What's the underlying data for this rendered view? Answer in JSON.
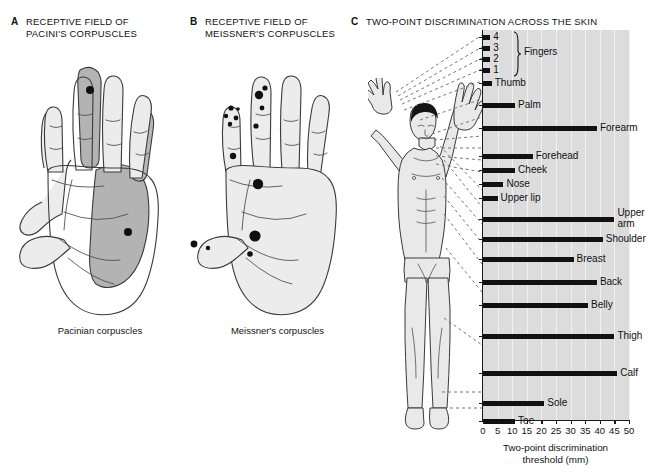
{
  "panels": {
    "a": {
      "letter": "A",
      "title": "RECEPTIVE FIELD OF PACINI'S CORPUSCLES",
      "caption": "Pacinian corpuscles"
    },
    "b": {
      "letter": "B",
      "title": "RECEPTIVE FIELD OF MEISSNER'S CORPUSCLES",
      "caption": "Meissner's corpuscles"
    },
    "c": {
      "letter": "C",
      "title": "TWO-POINT DISCRIMINATION ACROSS THE SKIN"
    }
  },
  "chart_data": {
    "type": "bar",
    "orientation": "horizontal",
    "title": "TWO-POINT DISCRIMINATION ACROSS THE SKIN",
    "xlabel": "Two-point discrimination threshold (mm)",
    "ylabel": "",
    "xlim": [
      0,
      50
    ],
    "xticks": [
      0,
      5,
      10,
      15,
      20,
      25,
      30,
      35,
      40,
      45,
      50
    ],
    "xtick_labels": [
      "0",
      "5",
      "10",
      "15",
      "20",
      "25",
      "30",
      "35",
      "40",
      "45",
      "50"
    ],
    "grid": true,
    "legend": false,
    "units": "mm",
    "group_label": "Fingers",
    "group_members": [
      "4",
      "3",
      "2",
      "1"
    ],
    "categories": [
      "4",
      "3",
      "2",
      "1",
      "Thumb",
      "Palm",
      "Forearm",
      "Forehead",
      "Cheek",
      "Nose",
      "Upper lip",
      "Upper arm",
      "Shoulder",
      "Breast",
      "Back",
      "Belly",
      "Thigh",
      "Calf",
      "Sole",
      "Toe"
    ],
    "values": [
      2.5,
      2.5,
      2.5,
      2.5,
      3,
      11,
      39,
      17,
      11,
      7,
      5,
      45,
      41,
      31,
      39,
      36,
      45,
      46,
      21,
      11
    ]
  },
  "bars": [
    {
      "label": "4",
      "value": 2.5,
      "label_pos": "outside"
    },
    {
      "label": "3",
      "value": 2.5,
      "label_pos": "outside"
    },
    {
      "label": "2",
      "value": 2.5,
      "label_pos": "outside"
    },
    {
      "label": "1",
      "value": 2.5,
      "label_pos": "outside"
    },
    {
      "label": "Thumb",
      "value": 3,
      "label_pos": "outside"
    },
    {
      "label": "Palm",
      "value": 11,
      "label_pos": "outside"
    },
    {
      "label": "Forearm",
      "value": 39,
      "label_pos": "outside"
    },
    {
      "label": "Forehead",
      "value": 17,
      "label_pos": "outside"
    },
    {
      "label": "Cheek",
      "value": 11,
      "label_pos": "outside"
    },
    {
      "label": "Nose",
      "value": 7,
      "label_pos": "outside"
    },
    {
      "label": "Upper lip",
      "value": 5,
      "label_pos": "outside"
    },
    {
      "label": "Upper arm",
      "value": 45,
      "label_pos": "outside-wrap"
    },
    {
      "label": "Shoulder",
      "value": 41,
      "label_pos": "outside"
    },
    {
      "label": "Breast",
      "value": 31,
      "label_pos": "outside"
    },
    {
      "label": "Back",
      "value": 39,
      "label_pos": "outside"
    },
    {
      "label": "Belly",
      "value": 36,
      "label_pos": "outside"
    },
    {
      "label": "Thigh",
      "value": 45,
      "label_pos": "outside"
    },
    {
      "label": "Calf",
      "value": 46,
      "label_pos": "outside"
    },
    {
      "label": "Sole",
      "value": 21,
      "label_pos": "outside"
    },
    {
      "label": "Toe",
      "value": 11,
      "label_pos": "outside"
    }
  ],
  "axis": {
    "x_title_line1": "Two-point discrimination",
    "x_title_line2": "threshold (mm)"
  },
  "colors": {
    "plot_background": "#dcdcdc",
    "gridline": "#f1f1f1",
    "bar": "#111111",
    "axis": "#1a1a1a",
    "skin_light": "#ececec",
    "skin_shade": "#b8b8b8",
    "outline": "#3a3a3a",
    "receptive_dot": "#101010",
    "hair": "#151515"
  }
}
